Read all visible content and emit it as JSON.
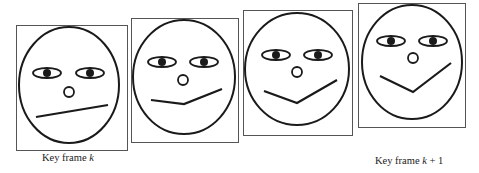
{
  "figure": {
    "stroke_color": "#1a1a1a",
    "frame_border_color": "#555555",
    "frames": [
      {
        "id": "frame-1",
        "box": [
          16,
          25,
          111,
          125
        ],
        "face": {
          "cx": 69,
          "cy": 85,
          "rx": 50,
          "ry": 58
        },
        "eyes": {
          "y": 73,
          "left_x": 47,
          "right_x": 90,
          "w": 28,
          "h": 10,
          "pupil_r": 4
        },
        "nose": {
          "cx": 69,
          "cy": 92,
          "r": 5
        },
        "mouth": [
          [
            36,
            117
          ],
          [
            108,
            105
          ]
        ]
      },
      {
        "id": "frame-2",
        "box": [
          131,
          18,
          107,
          124
        ],
        "face": {
          "cx": 184,
          "cy": 77,
          "rx": 51,
          "ry": 57
        },
        "eyes": {
          "y": 62,
          "left_x": 162,
          "right_x": 204,
          "w": 28,
          "h": 10,
          "pupil_r": 4
        },
        "nose": {
          "cx": 183,
          "cy": 80,
          "r": 5
        },
        "mouth": [
          [
            151,
            100
          ],
          [
            184,
            104
          ],
          [
            222,
            89
          ]
        ]
      },
      {
        "id": "frame-3",
        "box": [
          243,
          10,
          109,
          125
        ],
        "face": {
          "cx": 297,
          "cy": 69,
          "rx": 52,
          "ry": 56
        },
        "eyes": {
          "y": 55,
          "left_x": 276,
          "right_x": 318,
          "w": 28,
          "h": 10,
          "pupil_r": 4
        },
        "nose": {
          "cx": 297,
          "cy": 72,
          "r": 5
        },
        "mouth": [
          [
            264,
            91
          ],
          [
            297,
            103
          ],
          [
            337,
            80
          ]
        ]
      },
      {
        "id": "frame-4",
        "box": [
          358,
          3,
          107,
          124
        ],
        "face": {
          "cx": 412,
          "cy": 62,
          "rx": 50,
          "ry": 57
        },
        "eyes": {
          "y": 41,
          "left_x": 391,
          "right_x": 433,
          "w": 28,
          "h": 10,
          "pupil_r": 4
        },
        "nose": {
          "cx": 413,
          "cy": 58,
          "r": 5
        },
        "mouth": [
          [
            380,
            76
          ],
          [
            413,
            92
          ],
          [
            451,
            63
          ]
        ]
      }
    ],
    "labels": [
      {
        "id": "label-k",
        "prefix": "Key frame ",
        "var": "k",
        "suffix": "",
        "x": 42,
        "y": 152
      },
      {
        "id": "label-k1",
        "prefix": "Key frame ",
        "var": "k",
        "suffix": " + 1",
        "x": 375,
        "y": 155
      }
    ]
  }
}
